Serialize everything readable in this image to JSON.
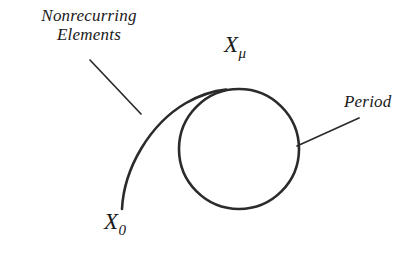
{
  "figure": {
    "background_color": "#ffffff",
    "stroke_color": "#2b2b2b",
    "canvas": {
      "width": 418,
      "height": 256
    }
  },
  "annotations": {
    "nonrecurring": {
      "line1": "Nonrecurring",
      "line2": "Elements"
    },
    "period": "Period"
  },
  "variables": {
    "x_mu": {
      "base": "X",
      "sub": "μ"
    },
    "x_zero": {
      "base": "X",
      "sub": "0"
    }
  },
  "geometry": {
    "circle": {
      "cx": 239,
      "cy": 149,
      "r": 60,
      "stroke_width": 2.6
    },
    "tail_path": "M 122 209 C 124 168, 150 124, 186 103 C 200 95, 212 91, 224 90",
    "leader_nonrecurring": {
      "x1": 90,
      "y1": 60,
      "x2": 141,
      "y2": 114
    },
    "leader_period": {
      "x1": 297,
      "y1": 146,
      "x2": 359,
      "y2": 118
    }
  }
}
